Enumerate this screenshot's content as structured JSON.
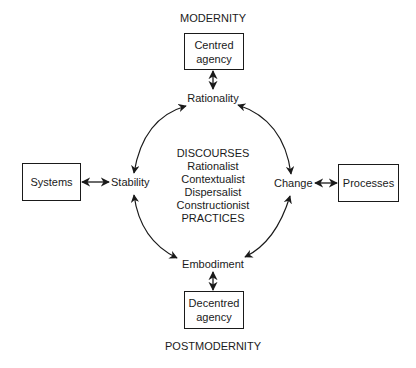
{
  "diagram": {
    "top_title": "MODERNITY",
    "bottom_title": "POSTMODERNITY",
    "boxes": {
      "top": [
        "Centred",
        "agency"
      ],
      "left": [
        "Systems"
      ],
      "right": [
        "Processes"
      ],
      "bottom": [
        "Decentred",
        "agency"
      ]
    },
    "nodes": {
      "top": "Rationality",
      "left": "Stability",
      "right": "Change",
      "bottom": "Embodiment"
    },
    "center": {
      "heading": "DISCOURSES",
      "items": [
        "Rationalist",
        "Contextualist",
        "Dispersalist",
        "Constructionist"
      ],
      "footer": "PRACTICES"
    },
    "connections": [
      {
        "from": "Centred agency",
        "to": "Rationality",
        "type": "bidirectional"
      },
      {
        "from": "Decentred agency",
        "to": "Embodiment",
        "type": "bidirectional"
      },
      {
        "from": "Systems",
        "to": "Stability",
        "type": "bidirectional"
      },
      {
        "from": "Processes",
        "to": "Change",
        "type": "bidirectional"
      },
      {
        "from": "Rationality",
        "to": "Change",
        "type": "bidirectional-arc"
      },
      {
        "from": "Change",
        "to": "Embodiment",
        "type": "bidirectional-arc"
      },
      {
        "from": "Embodiment",
        "to": "Stability",
        "type": "bidirectional-arc"
      },
      {
        "from": "Stability",
        "to": "Rationality",
        "type": "bidirectional-arc"
      }
    ],
    "line_color": "#1a1a1a"
  }
}
